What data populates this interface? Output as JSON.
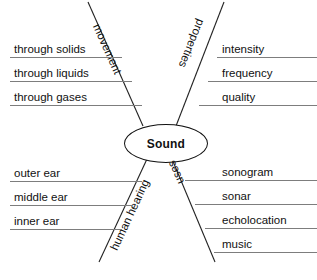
{
  "diagram": {
    "type": "concept-map",
    "center": {
      "label": "Sound"
    },
    "branches": [
      {
        "name": "movement",
        "label": "movement",
        "position": "upper-left",
        "items": [
          "through solids",
          "through liquids",
          "through gases"
        ]
      },
      {
        "name": "properties",
        "label": "properties",
        "position": "upper-right",
        "items": [
          "intensity",
          "frequency",
          "quality"
        ]
      },
      {
        "name": "human-hearing",
        "label": "human hearing",
        "position": "lower-left",
        "items": [
          "outer ear",
          "middle ear",
          "inner ear"
        ]
      },
      {
        "name": "uses",
        "label": "uses",
        "position": "lower-right",
        "items": [
          "sonogram",
          "sonar",
          "echolocation",
          "music"
        ]
      }
    ],
    "colors": {
      "ink": "#111111",
      "rule": "#7d7d7d",
      "background": "#ffffff"
    }
  },
  "caption": {
    "partial_text": ""
  }
}
